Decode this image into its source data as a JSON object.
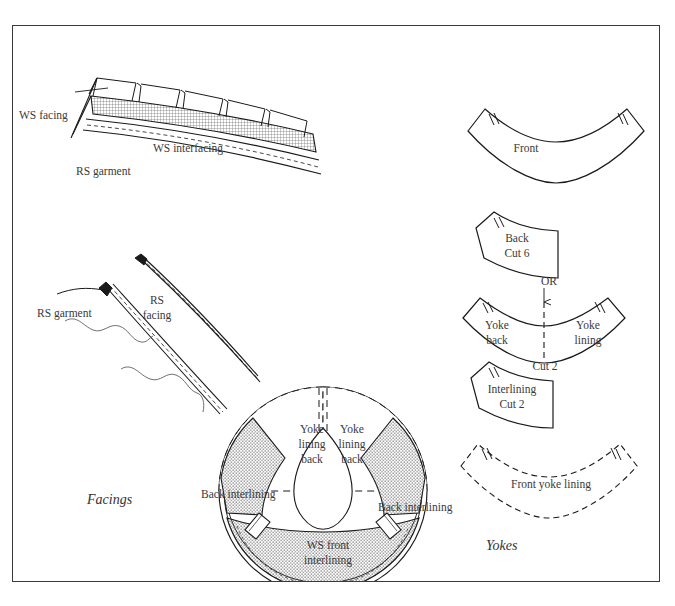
{
  "page": {
    "width": 675,
    "height": 606,
    "background": "#ffffff",
    "border_color": "#3a3a3a"
  },
  "sections": {
    "facings_caption": "Facings",
    "yokes_caption": "Yokes"
  },
  "figures": {
    "clipped_facing": {
      "name": "clipped-facing-illustration",
      "labels": {
        "ws_facing": "WS facing",
        "ws_interfacing": "WS interfacing",
        "rs_garment": "RS garment"
      }
    },
    "understitched_facing": {
      "name": "understitched-facing-illustration",
      "labels": {
        "rs_garment": "RS garment",
        "rs_facing_line1": "RS",
        "rs_facing_line2": "facing"
      }
    },
    "yoke_assembly": {
      "name": "circular-yoke-assembly",
      "labels": {
        "yoke_lining_back_left_l1": "Yoke",
        "yoke_lining_back_left_l2": "lining",
        "yoke_lining_back_left_l3": "back",
        "yoke_lining_back_right_l1": "Yoke",
        "yoke_lining_back_right_l2": "lining",
        "yoke_lining_back_right_l3": "back",
        "back_interlining_left": "Back interlining",
        "back_interlining_right": "Back interlining",
        "ws_front_interlining_l1": "WS front",
        "ws_front_interlining_l2": "interlining"
      }
    }
  },
  "pattern_pieces": [
    {
      "id": "front",
      "name": "pattern-piece-front",
      "label": "Front",
      "cut": "",
      "outline": "solid"
    },
    {
      "id": "back",
      "name": "pattern-piece-back",
      "label": "Back",
      "cut": "Cut 6",
      "outline": "solid"
    },
    {
      "id": "yoke-back-lining",
      "name": "pattern-piece-yoke-back-lining",
      "label_left": "Yoke back",
      "label_left_l1": "Yoke",
      "label_left_l2": "back",
      "label_right_l1": "Yoke",
      "label_right_l2": "lining",
      "cut": "Cut 2",
      "outline": "solid",
      "fold_line": "dashed"
    },
    {
      "id": "interlining",
      "name": "pattern-piece-interlining",
      "label": "Interlining",
      "cut": "Cut 2",
      "outline": "solid"
    },
    {
      "id": "front-yoke-lining",
      "name": "pattern-piece-front-yoke-lining",
      "label": "Front yoke lining",
      "cut": "",
      "outline": "dashed"
    }
  ],
  "connector": {
    "or_label": "OR",
    "arrow": "down-arrow"
  },
  "colors": {
    "ink": "#2b2b2b",
    "line": "#1a1a1a",
    "label": "#3a3a3a",
    "hatch": "#555555"
  }
}
